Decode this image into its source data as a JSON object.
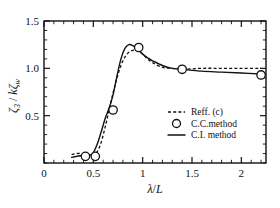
{
  "chart_data": {
    "type": "line",
    "title": "",
    "xlabel": "λ/L",
    "ylabel": "ζ3 / kζw",
    "xlim": [
      0,
      2.25
    ],
    "ylim": [
      0,
      1.5
    ],
    "grid": false,
    "legend_position": "center-right",
    "xticks": [
      0,
      0.5,
      1,
      1.5,
      2
    ],
    "xtick_labels": [
      "0",
      "0.5",
      "1",
      "1.5",
      "2"
    ],
    "yticks": [
      0.5,
      1.0,
      1.5
    ],
    "ytick_labels": [
      "0.5",
      "1.0",
      "1.5"
    ],
    "x_minor_step": 0.1,
    "y_minor_step": 0.1,
    "series": [
      {
        "name": "Reff. (c)",
        "style": "dashed",
        "x": [
          0.28,
          0.33,
          0.38,
          0.42,
          0.46,
          0.5,
          0.54,
          0.58,
          0.62,
          0.66,
          0.7,
          0.74,
          0.78,
          0.82,
          0.86,
          0.9,
          0.95,
          1.0,
          1.05,
          1.1,
          1.2,
          1.3,
          1.4,
          1.6,
          1.8,
          2.0,
          2.2
        ],
        "y": [
          0.09,
          0.1,
          0.1,
          0.09,
          0.08,
          0.08,
          0.12,
          0.22,
          0.38,
          0.56,
          0.74,
          0.9,
          1.03,
          1.12,
          1.17,
          1.19,
          1.19,
          1.15,
          1.1,
          1.06,
          1.01,
          1.0,
          0.99,
          1.0,
          1.0,
          1.0,
          1.0
        ]
      },
      {
        "name": "C.I. method",
        "style": "solid",
        "x": [
          0.28,
          0.33,
          0.38,
          0.42,
          0.46,
          0.5,
          0.54,
          0.58,
          0.62,
          0.66,
          0.7,
          0.74,
          0.78,
          0.82,
          0.86,
          0.9,
          0.95,
          1.0,
          1.05,
          1.1,
          1.2,
          1.3,
          1.4,
          1.6,
          1.8,
          2.0,
          2.2
        ],
        "y": [
          0.06,
          0.07,
          0.08,
          0.08,
          0.08,
          0.11,
          0.2,
          0.33,
          0.47,
          0.58,
          0.72,
          0.92,
          1.1,
          1.21,
          1.25,
          1.24,
          1.2,
          1.15,
          1.11,
          1.08,
          1.03,
          1.0,
          0.99,
          0.97,
          0.96,
          0.95,
          0.94
        ]
      },
      {
        "name": "C.C.method",
        "style": "markers",
        "x": [
          0.42,
          0.52,
          0.7,
          0.96,
          1.4,
          2.2
        ],
        "y": [
          0.07,
          0.07,
          0.56,
          1.22,
          0.99,
          0.93
        ]
      }
    ],
    "legend": [
      {
        "label": "Reff. (c)",
        "marker": "dashed-line"
      },
      {
        "label": "C.C.method",
        "marker": "open-circle"
      },
      {
        "label": "C.I. method",
        "marker": "solid-line"
      }
    ],
    "colors": {
      "axis": "#111111",
      "series": "#111111",
      "background": "#ffffff"
    }
  }
}
